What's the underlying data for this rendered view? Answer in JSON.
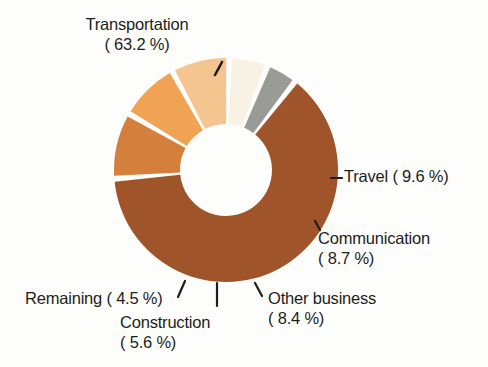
{
  "chart_data": {
    "type": "pie",
    "title": "",
    "subtitle": "",
    "xlabel": "",
    "ylabel": "",
    "legend_position": "none",
    "grid": false,
    "donut": true,
    "units": "%",
    "categories": [
      "Transportation",
      "Travel",
      "Communication",
      "Other business",
      "Construction",
      "Remaining"
    ],
    "values": [
      63.2,
      9.6,
      8.7,
      8.4,
      5.6,
      4.5
    ],
    "colors": [
      "#a0542a",
      "#d4803c",
      "#f0a354",
      "#f5c590",
      "#f7f2e4",
      "#9a9a96"
    ],
    "slices": [
      {
        "label": "Transportation",
        "value": 63.2,
        "value_text": "63.2 %",
        "color": "#a0542a"
      },
      {
        "label": "Travel",
        "value": 9.6,
        "value_text": "9.6 %",
        "color": "#d4803c"
      },
      {
        "label": "Communication",
        "value": 8.7,
        "value_text": "8.7 %",
        "color": "#f0a354"
      },
      {
        "label": "Other business",
        "value": 8.4,
        "value_text": "8.4 %",
        "color": "#f5c590"
      },
      {
        "label": "Construction",
        "value": 5.6,
        "value_text": "5.6 %",
        "color": "#f7f2e4"
      },
      {
        "label": "Remaining",
        "value": 4.5,
        "value_text": "4.5 %",
        "color": "#9a9a96"
      }
    ]
  },
  "labels": {
    "transportation": {
      "line1": "Transportation",
      "line2": "( 63.2 %)"
    },
    "travel": {
      "line1": "Travel (  9.6 %)"
    },
    "communication": {
      "line1": "Communication",
      "line2": "(  8.7 %)"
    },
    "other_business": {
      "line1": "Other business",
      "line2": "(  8.4 %)"
    },
    "construction": {
      "line1": "Construction",
      "line2": "(  5.6 %)"
    },
    "remaining": {
      "line1": "Remaining (  4.5 %)"
    }
  },
  "style": {
    "background": "#fdfdfc",
    "text_color": "#1d1d1b",
    "gap_color": "#ffffff"
  }
}
